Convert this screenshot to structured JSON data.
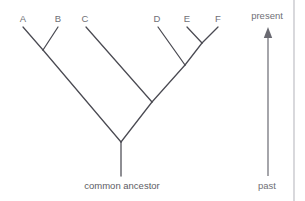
{
  "figure": {
    "type": "phylogenetic-tree",
    "background_color": "#ffffff",
    "line_color": "#4a4a52",
    "text_color": "#6f6f76",
    "border_line_color": "#b9b9bf"
  },
  "taxa": [
    {
      "label": "A",
      "x": 23,
      "label_x": 16,
      "label_y": 14
    },
    {
      "label": "B",
      "x": 58,
      "label_x": 51,
      "label_y": 14
    },
    {
      "label": "C",
      "x": 86,
      "label_x": 78,
      "label_y": 14
    },
    {
      "label": "D",
      "x": 158,
      "label_x": 150,
      "label_y": 14
    },
    {
      "label": "E",
      "x": 187,
      "label_x": 180,
      "label_y": 14
    },
    {
      "label": "F",
      "x": 218,
      "label_x": 211,
      "label_y": 14
    }
  ],
  "root": {
    "label": "common ancestor",
    "label_x": 72,
    "label_y": 181,
    "label_width": 100
  },
  "time_axis": {
    "present_label": "present",
    "present_x": 243,
    "present_y": 11,
    "past_label": "past",
    "past_x": 248,
    "past_y": 181,
    "axis_width": 48,
    "arrow_x": 268,
    "arrow_top_y": 27,
    "arrow_bottom_y": 176
  },
  "chart_data": {
    "type": "tree",
    "newick": "((A,B),(C,(D,(E,F))))common_ancestor;",
    "tip_y": 27,
    "nodes": [
      {
        "name": "tip-A",
        "x": 23,
        "y": 27
      },
      {
        "name": "tip-B",
        "x": 58,
        "y": 27
      },
      {
        "name": "tip-C",
        "x": 86,
        "y": 27
      },
      {
        "name": "tip-D",
        "x": 158,
        "y": 27
      },
      {
        "name": "tip-E",
        "x": 187,
        "y": 27
      },
      {
        "name": "tip-F",
        "x": 218,
        "y": 27
      },
      {
        "name": "node-AB",
        "x": 43,
        "y": 50
      },
      {
        "name": "node-EF",
        "x": 202,
        "y": 43
      },
      {
        "name": "node-DEF",
        "x": 185,
        "y": 65
      },
      {
        "name": "node-CDEF",
        "x": 152,
        "y": 102
      },
      {
        "name": "node-root",
        "x": 121,
        "y": 142
      },
      {
        "name": "root-stem-end",
        "x": 121,
        "y": 176
      }
    ],
    "branches": [
      {
        "name": "branch-A",
        "x1": 23,
        "y1": 27,
        "x2": 43,
        "y2": 50
      },
      {
        "name": "branch-B",
        "x1": 58,
        "y1": 27,
        "x2": 43,
        "y2": 50
      },
      {
        "name": "branch-AB",
        "x1": 43,
        "y1": 50,
        "x2": 121,
        "y2": 142
      },
      {
        "name": "branch-C",
        "x1": 86,
        "y1": 27,
        "x2": 152,
        "y2": 102
      },
      {
        "name": "branch-E",
        "x1": 187,
        "y1": 27,
        "x2": 202,
        "y2": 43
      },
      {
        "name": "branch-F",
        "x1": 218,
        "y1": 27,
        "x2": 202,
        "y2": 43
      },
      {
        "name": "branch-EF",
        "x1": 202,
        "y1": 43,
        "x2": 185,
        "y2": 65
      },
      {
        "name": "branch-D",
        "x1": 158,
        "y1": 27,
        "x2": 185,
        "y2": 65
      },
      {
        "name": "branch-DEF",
        "x1": 185,
        "y1": 65,
        "x2": 152,
        "y2": 102
      },
      {
        "name": "branch-CDEF",
        "x1": 152,
        "y1": 102,
        "x2": 121,
        "y2": 142
      },
      {
        "name": "branch-root-stem",
        "x1": 121,
        "y1": 142,
        "x2": 121,
        "y2": 176
      }
    ],
    "title": "",
    "xlabel": "",
    "ylabel": "time"
  }
}
